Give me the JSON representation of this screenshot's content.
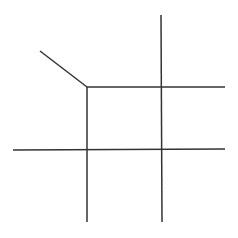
{
  "diagram": {
    "width": 238,
    "height": 238,
    "background": "#ffffff",
    "stroke_color": "#333333",
    "stroke_width": 1.5,
    "segments": [
      {
        "name": "diagonal-segment",
        "x1": 40,
        "y1": 51,
        "x2": 87,
        "y2": 87
      },
      {
        "name": "top-horizontal-segment",
        "x1": 87,
        "y1": 87,
        "x2": 225,
        "y2": 87
      },
      {
        "name": "bottom-horizontal-segment",
        "x1": 13,
        "y1": 150,
        "x2": 225,
        "y2": 149
      },
      {
        "name": "left-vertical-segment",
        "x1": 87,
        "y1": 87,
        "x2": 87,
        "y2": 222
      },
      {
        "name": "right-vertical-segment",
        "x1": 161,
        "y1": 15,
        "x2": 162,
        "y2": 222
      }
    ]
  }
}
